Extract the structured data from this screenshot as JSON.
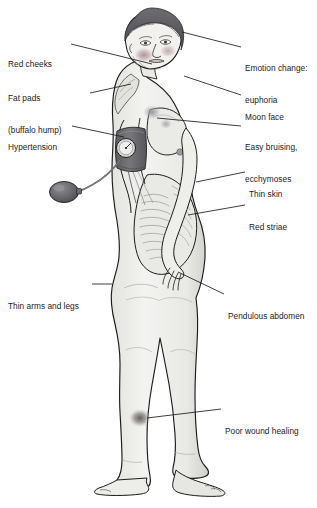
{
  "figure": {
    "background_color": "#ffffff",
    "line_color": "#1b1b1b",
    "skin_fill": "#efefed",
    "skin_shadow": "#c9c9c6",
    "hair_color": "#56565a",
    "cheek_color": "#b7a0a4",
    "bruise_color": "#a9a7ab",
    "cuff_color": "#6f6f73",
    "wound_color": "#77716e",
    "width": 317,
    "height": 508
  },
  "labels": [
    {
      "id": "red-cheeks",
      "text": "Red cheeks",
      "side": "left",
      "lines": [
        "Red cheeks"
      ],
      "text_x": 8,
      "text_y": 38,
      "leader": {
        "x1": 71,
        "y1": 44,
        "x2": 152,
        "y2": 64
      }
    },
    {
      "id": "fat-pads",
      "text": "Fat pads (buffalo hump)",
      "side": "left",
      "lines": [
        "Fat pads",
        "(buffalo hump)"
      ],
      "text_x": 8,
      "text_y": 72,
      "leader": {
        "x1": 90,
        "y1": 93,
        "x2": 131,
        "y2": 84
      }
    },
    {
      "id": "hypertension",
      "text": "Hypertension",
      "side": "left",
      "lines": [
        "Hypertension"
      ],
      "text_x": 8,
      "text_y": 121,
      "leader": {
        "x1": 72,
        "y1": 126,
        "x2": 124,
        "y2": 137
      }
    },
    {
      "id": "thin-arms-and-legs",
      "text": "Thin arms and legs",
      "side": "left",
      "lines": [
        "Thin arms and legs"
      ],
      "text_x": 8,
      "text_y": 280,
      "leader": {
        "x1": 92,
        "y1": 284,
        "x2": 112,
        "y2": 284
      }
    },
    {
      "id": "emotion-change-euphoria",
      "text": "Emotion change: euphoria",
      "side": "right",
      "lines": [
        "Emotion change:",
        "euphoria"
      ],
      "text_x": 245,
      "text_y": 42,
      "leader": {
        "x1": 241,
        "y1": 47,
        "x2": 182,
        "y2": 32
      }
    },
    {
      "id": "moon-face",
      "text": "Moon face",
      "side": "right",
      "lines": [
        "Moon face"
      ],
      "text_x": 245,
      "text_y": 91,
      "leader": {
        "x1": 241,
        "y1": 95,
        "x2": 184,
        "y2": 76
      }
    },
    {
      "id": "easy-bruising-ecchymoses",
      "text": "Easy bruising, ecchymoses",
      "side": "right",
      "lines": [
        "Easy bruising,",
        "ecchymoses"
      ],
      "text_x": 245,
      "text_y": 121,
      "leader": {
        "x1": 241,
        "y1": 126,
        "x2": 157,
        "y2": 118
      }
    },
    {
      "id": "thin-skin",
      "text": "Thin skin",
      "side": "right",
      "lines": [
        "Thin skin"
      ],
      "text_x": 249,
      "text_y": 168,
      "leader": {
        "x1": 245,
        "y1": 172,
        "x2": 196,
        "y2": 182
      }
    },
    {
      "id": "red-striae",
      "text": "Red striae",
      "side": "right",
      "lines": [
        "Red striae"
      ],
      "text_x": 249,
      "text_y": 201,
      "leader": {
        "x1": 245,
        "y1": 205,
        "x2": 188,
        "y2": 215
      }
    },
    {
      "id": "pendulous-abdomen",
      "text": "Pendulous abdomen",
      "side": "right",
      "lines": [
        "Pendulous abdomen"
      ],
      "text_x": 228,
      "text_y": 290,
      "leader": {
        "x1": 224,
        "y1": 294,
        "x2": 178,
        "y2": 272
      }
    },
    {
      "id": "poor-wound-healing",
      "text": "Poor wound healing",
      "side": "right",
      "lines": [
        "Poor wound healing"
      ],
      "text_x": 225,
      "text_y": 405,
      "leader": {
        "x1": 221,
        "y1": 409,
        "x2": 147,
        "y2": 418
      }
    }
  ],
  "features": {
    "cheek_blush": "red-cheek-patch",
    "buffalo_hump": "upper-back-fat-pad",
    "bp_cuff": "sphygmomanometer-cuff",
    "bp_gauge": "pressure-gauge-dial",
    "bp_bulb": "inflation-bulb",
    "bruise_spots": "ecchymosis-patches",
    "striae": "abdominal-striae-lines",
    "wound": "poorly-healing-shin-wound"
  }
}
